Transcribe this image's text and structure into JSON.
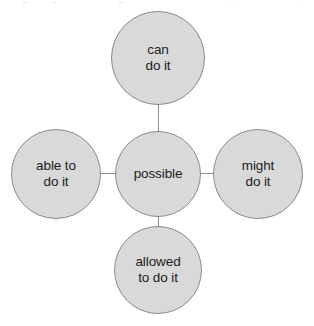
{
  "diagram": {
    "type": "word-web",
    "background_color": "#ffffff",
    "node_fill_color": "#d9d9d9",
    "node_border_color": "#8a8a8a",
    "connector_color": "#8d8d8d",
    "text_color": "#1c1c1c",
    "center": {
      "id": "possible",
      "label": "possible",
      "position": "center"
    },
    "satellites": [
      {
        "id": "can-do-it",
        "label": "can\ndo it",
        "position": "top"
      },
      {
        "id": "able-to-do-it",
        "label": "able to\ndo it",
        "position": "left"
      },
      {
        "id": "might-do-it",
        "label": "might\ndo it",
        "position": "right"
      },
      {
        "id": "allowed-to-do-it",
        "label": "allowed\nto do it",
        "position": "bottom"
      }
    ],
    "connectors": [
      {
        "from": "possible",
        "to": "can-do-it",
        "orientation": "vertical"
      },
      {
        "from": "possible",
        "to": "able-to-do-it",
        "orientation": "horizontal"
      },
      {
        "from": "possible",
        "to": "might-do-it",
        "orientation": "horizontal"
      },
      {
        "from": "possible",
        "to": "allowed-to-do-it",
        "orientation": "vertical"
      }
    ]
  }
}
